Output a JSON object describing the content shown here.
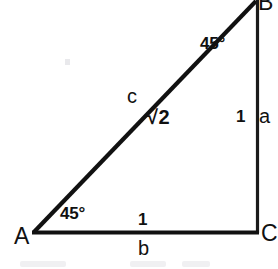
{
  "figure": {
    "background_color": "#ffffff",
    "stroke_color": "#111111",
    "text_color": "#111111"
  },
  "vertices": {
    "a_label": "A",
    "b_label": "B",
    "c_label": "C"
  },
  "angles": {
    "at_a": "45°",
    "at_b": "45°"
  },
  "sides": {
    "opposite_a": "a",
    "opposite_b": "b",
    "hypotenuse_c": "c"
  },
  "lengths": {
    "leg_a": "1",
    "leg_b": "1",
    "hypotenuse": "√2"
  },
  "geometry": {
    "point_A": [
      33,
      232
    ],
    "point_B": [
      257,
      2
    ],
    "point_C": [
      257,
      232
    ],
    "hypotenuse_width_px": 4,
    "base_width_px": 4,
    "vertical_width_px": 3
  }
}
